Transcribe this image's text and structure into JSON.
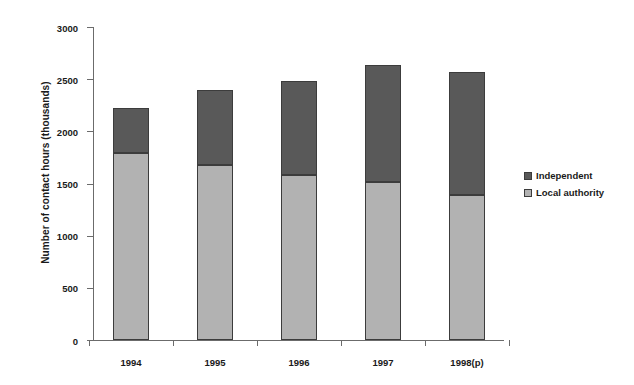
{
  "chart_data": {
    "type": "bar",
    "subtype": "stacked-vertical",
    "title": "",
    "subtitle": "",
    "xlabel": "",
    "ylabel": "Number of contact hours (thousands)",
    "categories": [
      "1994",
      "1995",
      "1996",
      "1997",
      "1998(p)"
    ],
    "series": [
      {
        "name": "Local authority",
        "color": "#b2b2b2",
        "values": [
          1790,
          1680,
          1580,
          1510,
          1390
        ]
      },
      {
        "name": "Independent",
        "color": "#595959",
        "values": [
          430,
          720,
          900,
          1125,
          1175
        ]
      }
    ],
    "totals": [
      2220,
      2400,
      2480,
      2635,
      2565
    ],
    "ylim": [
      0,
      3000
    ],
    "yticks": [
      0,
      500,
      1000,
      1500,
      2000,
      2500,
      3000
    ],
    "ytick_labels": [
      "0",
      "500",
      "1000",
      "1500",
      "2000",
      "2500",
      "3000"
    ],
    "grid": false,
    "legend_position": "right",
    "stack_order": [
      "Local authority",
      "Independent"
    ],
    "axis_color": "#6b6b6b"
  },
  "legend": {
    "entries": [
      {
        "label": "Independent",
        "color": "#595959"
      },
      {
        "label": "Local authority",
        "color": "#b2b2b2"
      }
    ]
  }
}
